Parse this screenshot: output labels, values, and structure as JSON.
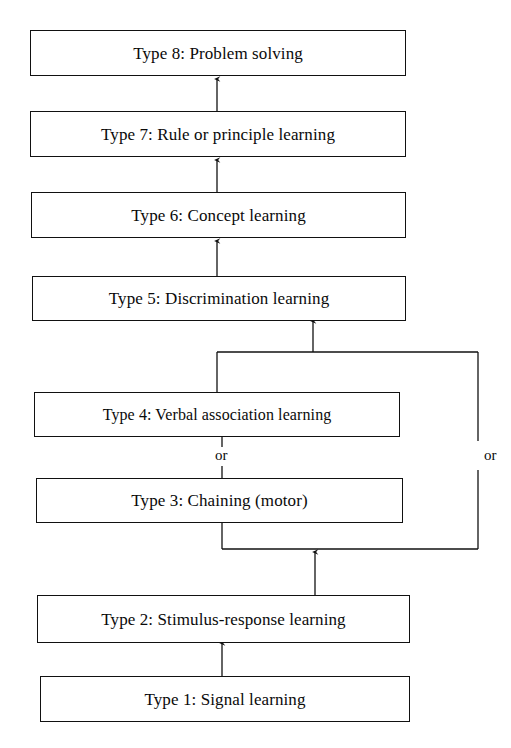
{
  "diagram": {
    "background_color": "#ffffff",
    "line_color": "#111111",
    "text_color": "#0a0a0a",
    "nodes": [
      {
        "id": "type8",
        "label": "Type 8:  Problem solving",
        "font_size": 17
      },
      {
        "id": "type7",
        "label": "Type 7:  Rule or principle learning",
        "font_size": 17
      },
      {
        "id": "type6",
        "label": "Type 6:  Concept learning",
        "font_size": 17
      },
      {
        "id": "type5",
        "label": "Type 5:  Discrimination learning",
        "font_size": 17
      },
      {
        "id": "type4",
        "label": "Type 4:  Verbal association learning",
        "font_size": 16
      },
      {
        "id": "type3",
        "label": "Type 3:  Chaining (motor)",
        "font_size": 17
      },
      {
        "id": "type2",
        "label": "Type 2:  Stimulus-response learning",
        "font_size": 17
      },
      {
        "id": "type1",
        "label": "Type 1:  Signal learning",
        "font_size": 17
      }
    ],
    "connector_labels": {
      "middle_or": "or",
      "right_or": "or"
    }
  }
}
